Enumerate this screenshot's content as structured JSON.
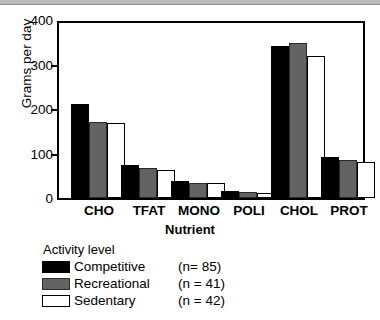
{
  "chart_data": {
    "type": "bar",
    "title": "",
    "xlabel": "Nutrient",
    "ylabel": "Grams per day",
    "categories": [
      "CHO",
      "TFAT",
      "MONO",
      "POLI",
      "CHOL",
      "PROT"
    ],
    "series": [
      {
        "name": "Competitive",
        "n": 85,
        "color": "#000000",
        "values": [
          213,
          75,
          38,
          17,
          345,
          92
        ]
      },
      {
        "name": "Recreational",
        "n": 41,
        "color": "#636363",
        "values": [
          173,
          68,
          34,
          14,
          351,
          85
        ]
      },
      {
        "name": "Sedentary",
        "n": 42,
        "color": "#ffffff",
        "values": [
          170,
          63,
          33,
          11,
          322,
          82
        ]
      }
    ],
    "ylim": [
      0,
      400
    ],
    "yticks": [
      0,
      100,
      200,
      300,
      400
    ],
    "ytick_labels": [
      "0",
      "100",
      "200",
      "300",
      "400"
    ],
    "grid": false,
    "legend_position": "below-left"
  },
  "axes": {
    "y_title": "Grams per day",
    "x_title": "Nutrient",
    "y_tick_labels": [
      "400",
      "300",
      "200",
      "100",
      "0"
    ],
    "x_tick_labels": [
      "CHO",
      "TFAT",
      "MONO",
      "POLI",
      "CHOL",
      "PROT"
    ]
  },
  "legend": {
    "title": "Activity level",
    "entries": [
      {
        "label": "Competitive",
        "n_text": "(n= 85)",
        "swatch": "black-filled-swatch"
      },
      {
        "label": "Recreational",
        "n_text": "(n = 41)",
        "swatch": "gray-filled-swatch"
      },
      {
        "label": "Sedentary",
        "n_text": "(n = 42)",
        "swatch": "white-open-swatch"
      }
    ]
  }
}
